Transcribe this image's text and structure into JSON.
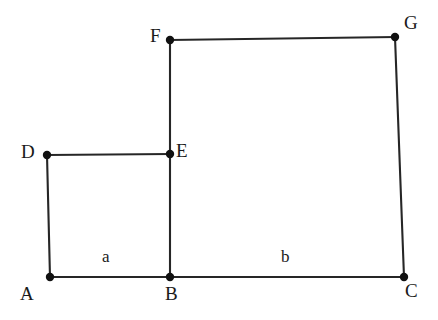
{
  "figure": {
    "kind": "geometry-diagram",
    "width": 438,
    "height": 320,
    "background_color": "#ffffff",
    "line_color": "#262626",
    "line_width": 2.1,
    "vertex_dot_color": "#111111",
    "vertex_dot_radius": 4.2,
    "label_color": "#1a1a1a"
  },
  "points": [
    {
      "id": "A",
      "label": "A",
      "x": 50,
      "y": 277,
      "label_x": 20,
      "label_y": 284,
      "dot": true
    },
    {
      "id": "B",
      "label": "B",
      "x": 170,
      "y": 277,
      "label_x": 165,
      "label_y": 284,
      "dot": true
    },
    {
      "id": "C",
      "label": "C",
      "x": 404,
      "y": 277,
      "label_x": 405,
      "label_y": 281,
      "dot": true
    },
    {
      "id": "D",
      "label": "D",
      "x": 47,
      "y": 155,
      "label_x": 21,
      "label_y": 142,
      "dot": true
    },
    {
      "id": "E",
      "label": "E",
      "x": 170,
      "y": 154,
      "label_x": 176,
      "label_y": 141,
      "dot": true
    },
    {
      "id": "F",
      "label": "F",
      "x": 170,
      "y": 40,
      "label_x": 150,
      "label_y": 26,
      "dot": true
    },
    {
      "id": "G",
      "label": "G",
      "x": 395,
      "y": 37,
      "label_x": 404,
      "label_y": 13,
      "dot": true
    }
  ],
  "edges": [
    {
      "id": "AB",
      "from": "A",
      "to": "B",
      "name": "edge-a-b"
    },
    {
      "id": "BC",
      "from": "B",
      "to": "C",
      "name": "edge-b-c"
    },
    {
      "id": "AD",
      "from": "A",
      "to": "D",
      "name": "edge-a-d"
    },
    {
      "id": "DE",
      "from": "D",
      "to": "E",
      "name": "edge-d-e"
    },
    {
      "id": "BF",
      "from": "B",
      "to": "F",
      "name": "edge-b-f"
    },
    {
      "id": "FG",
      "from": "F",
      "to": "G",
      "name": "edge-f-g"
    },
    {
      "id": "GC",
      "from": "G",
      "to": "C",
      "name": "edge-g-c"
    }
  ],
  "side_labels": [
    {
      "id": "a",
      "text": "a",
      "x": 102,
      "y": 248,
      "segment": "AB",
      "name": "side-label-a"
    },
    {
      "id": "b",
      "text": "b",
      "x": 281,
      "y": 248,
      "segment": "BC",
      "name": "side-label-b"
    }
  ]
}
